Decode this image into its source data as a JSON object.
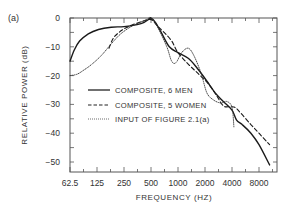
{
  "chart_data": {
    "type": "line",
    "panel_label": "(a)",
    "xlabel": "FREQUENCY (HZ)",
    "ylabel": "RELATIVE POWER (dB)",
    "x_scale": "log2",
    "xlim": [
      62.5,
      11000
    ],
    "ylim": [
      -52,
      0
    ],
    "x_ticks": [
      "62.5",
      "125",
      "250",
      "500",
      "1000",
      "2000",
      "4000",
      "8000"
    ],
    "x_tick_values": [
      62.5,
      125,
      250,
      500,
      1000,
      2000,
      4000,
      8000
    ],
    "y_ticks": [
      "0",
      "-10",
      "-20",
      "-30",
      "-40",
      "-50"
    ],
    "y_tick_values": [
      0,
      -10,
      -20,
      -30,
      -40,
      -50
    ],
    "grid": false,
    "legend_position": "inside center-left",
    "series": [
      {
        "name": "COMPOSITE, 6 MEN",
        "style": "solid",
        "x": [
          62.5,
          70,
          80,
          100,
          130,
          180,
          250,
          350,
          420,
          480,
          500,
          560,
          650,
          800,
          1000,
          1300,
          1600,
          2000,
          2600,
          3200,
          4000,
          4500,
          5200,
          6500,
          8000,
          10500
        ],
        "y": [
          -15,
          -11,
          -8,
          -5.5,
          -4,
          -3.2,
          -3,
          -2.3,
          -1.5,
          -0.3,
          0,
          -1.5,
          -5,
          -10,
          -12,
          -14,
          -17,
          -21,
          -26,
          -29,
          -32,
          -35.5,
          -37,
          -40,
          -44,
          -51
        ]
      },
      {
        "name": "COMPOSITE, 5 WOMEN",
        "style": "dashed",
        "x": [
          170,
          190,
          220,
          260,
          320,
          400,
          480,
          520,
          600,
          700,
          850,
          1000,
          1300,
          1700,
          2200,
          2700,
          3200,
          3800,
          4300,
          5000,
          6500,
          8000,
          10500
        ],
        "y": [
          -10.5,
          -7,
          -5,
          -3.5,
          -2.2,
          -1.2,
          -0.5,
          -0.8,
          -3,
          -5,
          -8,
          -12,
          -16,
          -19.5,
          -23,
          -27,
          -30.5,
          -30.8,
          -31,
          -33,
          -37,
          -40,
          -44
        ]
      },
      {
        "name": "INPUT OF FIGURE 2.1(a)",
        "style": "dotted",
        "x": [
          62.5,
          75,
          90,
          110,
          140,
          180,
          230,
          300,
          380,
          450,
          500,
          600,
          750,
          850,
          950,
          1100,
          1300,
          1500,
          1800,
          2100,
          2500,
          3000,
          3500,
          4000,
          4200
        ],
        "y": [
          -20,
          -19.5,
          -18,
          -16,
          -13,
          -9,
          -5.5,
          -3,
          -1.5,
          -0.5,
          0,
          -3.5,
          -10,
          -15,
          -15.5,
          -12,
          -10.5,
          -13,
          -19,
          -26,
          -28.5,
          -29.5,
          -29,
          -31,
          -38
        ]
      }
    ]
  }
}
